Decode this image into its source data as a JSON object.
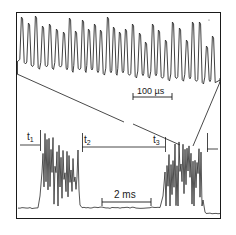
{
  "figure": {
    "colors": {
      "trace": "#2a2a2a",
      "frame": "#1a1a1a",
      "background": "#ffffff"
    }
  },
  "top_trace": {
    "scale_bar_label": "100 µs",
    "peak_count": 27,
    "peaks_x": [
      22,
      29,
      36,
      43,
      50,
      57,
      64,
      70,
      76,
      83,
      89,
      95,
      101,
      108,
      114,
      120,
      126,
      133,
      140,
      146,
      153,
      159,
      166,
      173,
      180,
      187,
      193,
      200,
      207,
      213
    ],
    "peaks_y": [
      17,
      23,
      16,
      26,
      24,
      29,
      32,
      18,
      31,
      20,
      29,
      24,
      30,
      17,
      27,
      32,
      29,
      24,
      33,
      42,
      24,
      30,
      40,
      22,
      28,
      40,
      22,
      22,
      46,
      36
    ]
  },
  "bottom_trace": {
    "scale_bar_label": "2 ms",
    "markers": [
      {
        "name": "t",
        "sub": "1",
        "x": 40
      },
      {
        "name": "t",
        "sub": "2",
        "x": 82
      },
      {
        "name": "t",
        "sub": "3",
        "x": 165
      }
    ]
  }
}
